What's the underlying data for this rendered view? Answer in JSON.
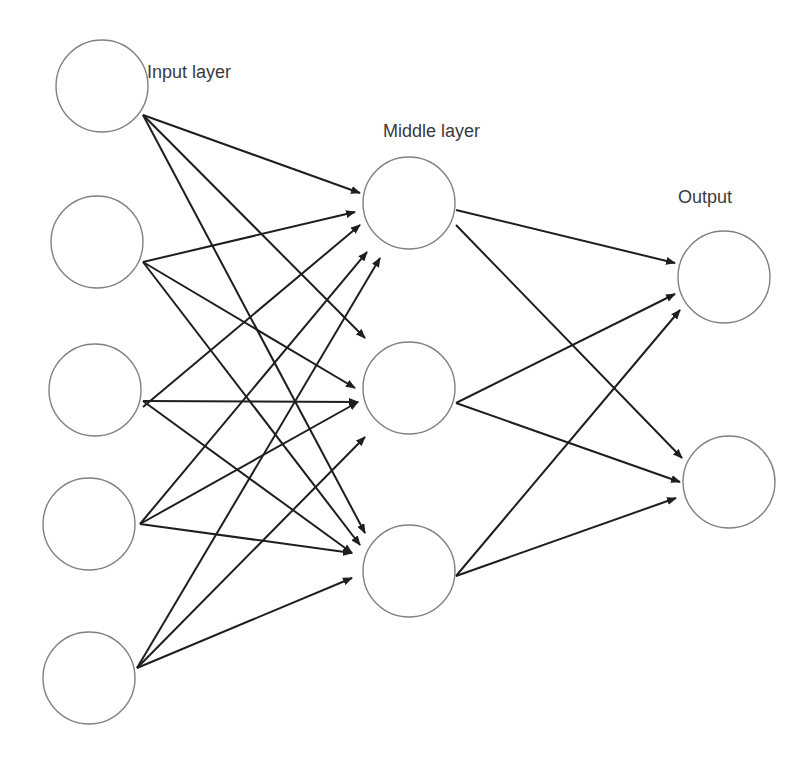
{
  "diagram": {
    "labels": {
      "input": "Input layer",
      "middle": "Middle layer",
      "output": "Output"
    },
    "colors": {
      "node_stroke": "#808080",
      "edge": "#1e1e1e",
      "text": "#3a3a3a",
      "background": "#ffffff"
    },
    "layers": [
      {
        "name": "input",
        "nodes": [
          {
            "id": "i1",
            "cx": 102,
            "cy": 86
          },
          {
            "id": "i2",
            "cx": 97,
            "cy": 242
          },
          {
            "id": "i3",
            "cx": 95,
            "cy": 390
          },
          {
            "id": "i4",
            "cx": 89,
            "cy": 524
          },
          {
            "id": "i5",
            "cx": 89,
            "cy": 678
          }
        ]
      },
      {
        "name": "middle",
        "nodes": [
          {
            "id": "m1",
            "cx": 409,
            "cy": 203
          },
          {
            "id": "m2",
            "cx": 409,
            "cy": 388
          },
          {
            "id": "m3",
            "cx": 409,
            "cy": 571
          }
        ]
      },
      {
        "name": "output",
        "nodes": [
          {
            "id": "o1",
            "cx": 724,
            "cy": 277
          },
          {
            "id": "o2",
            "cx": 729,
            "cy": 482
          }
        ]
      }
    ],
    "node_radius": 46,
    "edges": [
      {
        "from": "i1",
        "to": "m1",
        "x1": 143,
        "y1": 115,
        "x2": 360,
        "y2": 193
      },
      {
        "from": "i1",
        "to": "m2",
        "x1": 143,
        "y1": 115,
        "x2": 365,
        "y2": 338
      },
      {
        "from": "i1",
        "to": "m3",
        "x1": 143,
        "y1": 115,
        "x2": 365,
        "y2": 533
      },
      {
        "from": "i2",
        "to": "m1",
        "x1": 143,
        "y1": 262,
        "x2": 355,
        "y2": 212
      },
      {
        "from": "i2",
        "to": "m2",
        "x1": 143,
        "y1": 262,
        "x2": 355,
        "y2": 388
      },
      {
        "from": "i2",
        "to": "m3",
        "x1": 143,
        "y1": 262,
        "x2": 360,
        "y2": 545
      },
      {
        "from": "i3",
        "to": "m1",
        "x1": 143,
        "y1": 407,
        "x2": 360,
        "y2": 225
      },
      {
        "from": "i3",
        "to": "m2",
        "x1": 143,
        "y1": 401,
        "x2": 358,
        "y2": 402
      },
      {
        "from": "i3",
        "to": "m3",
        "x1": 143,
        "y1": 401,
        "x2": 352,
        "y2": 553
      },
      {
        "from": "i4",
        "to": "m1",
        "x1": 140,
        "y1": 524,
        "x2": 367,
        "y2": 252
      },
      {
        "from": "i4",
        "to": "m2",
        "x1": 140,
        "y1": 524,
        "x2": 358,
        "y2": 402
      },
      {
        "from": "i4",
        "to": "m3",
        "x1": 140,
        "y1": 524,
        "x2": 352,
        "y2": 553
      },
      {
        "from": "i5",
        "to": "m1",
        "x1": 137,
        "y1": 668,
        "x2": 380,
        "y2": 258
      },
      {
        "from": "i5",
        "to": "m2",
        "x1": 137,
        "y1": 668,
        "x2": 365,
        "y2": 437
      },
      {
        "from": "i5",
        "to": "m3",
        "x1": 137,
        "y1": 668,
        "x2": 352,
        "y2": 578
      },
      {
        "from": "m1",
        "to": "o1",
        "x1": 456,
        "y1": 210,
        "x2": 675,
        "y2": 263
      },
      {
        "from": "m1",
        "to": "o2",
        "x1": 456,
        "y1": 225,
        "x2": 682,
        "y2": 458
      },
      {
        "from": "m2",
        "to": "o1",
        "x1": 456,
        "y1": 403,
        "x2": 675,
        "y2": 294
      },
      {
        "from": "m2",
        "to": "o2",
        "x1": 456,
        "y1": 403,
        "x2": 680,
        "y2": 482
      },
      {
        "from": "m3",
        "to": "o1",
        "x1": 456,
        "y1": 576,
        "x2": 680,
        "y2": 310
      },
      {
        "from": "m3",
        "to": "o2",
        "x1": 456,
        "y1": 576,
        "x2": 676,
        "y2": 498
      }
    ]
  }
}
